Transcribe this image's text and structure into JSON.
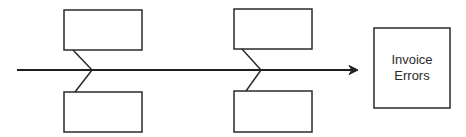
{
  "diagram": {
    "type": "fishbone",
    "effect": {
      "line1": "Invoice",
      "line2": "Errors"
    },
    "cause_boxes": [
      {
        "position": "left-top",
        "label": ""
      },
      {
        "position": "left-bottom",
        "label": ""
      },
      {
        "position": "right-top",
        "label": ""
      },
      {
        "position": "right-bottom",
        "label": ""
      }
    ],
    "colors": {
      "stroke": "#2a2a2a",
      "background": "#ffffff"
    }
  }
}
